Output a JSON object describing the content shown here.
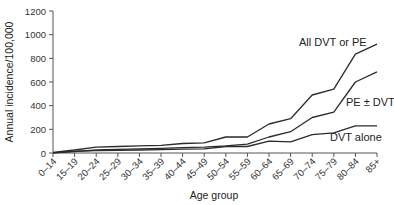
{
  "chart_data": {
    "type": "line",
    "title": "",
    "xlabel": "Age group",
    "ylabel": "Annual incidence/100,000",
    "ylim": [
      0,
      1200
    ],
    "yticks": [
      0,
      200,
      400,
      600,
      800,
      1000,
      1200
    ],
    "grid": false,
    "legend": "inline labels",
    "categories": [
      "0–14",
      "15–19",
      "20–24",
      "25–29",
      "30–34",
      "35–39",
      "40–44",
      "45–49",
      "50–54",
      "55–59",
      "60–64",
      "65–69",
      "70–74",
      "75–79",
      "80–84",
      "85+"
    ],
    "series": [
      {
        "name": "All DVT or PE",
        "values": [
          5,
          25,
          50,
          55,
          60,
          65,
          80,
          85,
          135,
          135,
          245,
          290,
          490,
          540,
          835,
          920
        ]
      },
      {
        "name": "PE ± DVT",
        "values": [
          2,
          12,
          25,
          30,
          35,
          40,
          45,
          50,
          60,
          75,
          135,
          180,
          300,
          345,
          600,
          685
        ]
      },
      {
        "name": "DVT alone",
        "values": [
          2,
          15,
          20,
          22,
          25,
          28,
          33,
          35,
          55,
          55,
          100,
          95,
          155,
          170,
          230,
          230
        ]
      }
    ]
  },
  "labels": {
    "all": "All DVT or PE",
    "pe": "PE ± DVT",
    "dvt": "DVT alone",
    "xlabel": "Age group",
    "ylabel": "Annual incidence/100,000"
  }
}
